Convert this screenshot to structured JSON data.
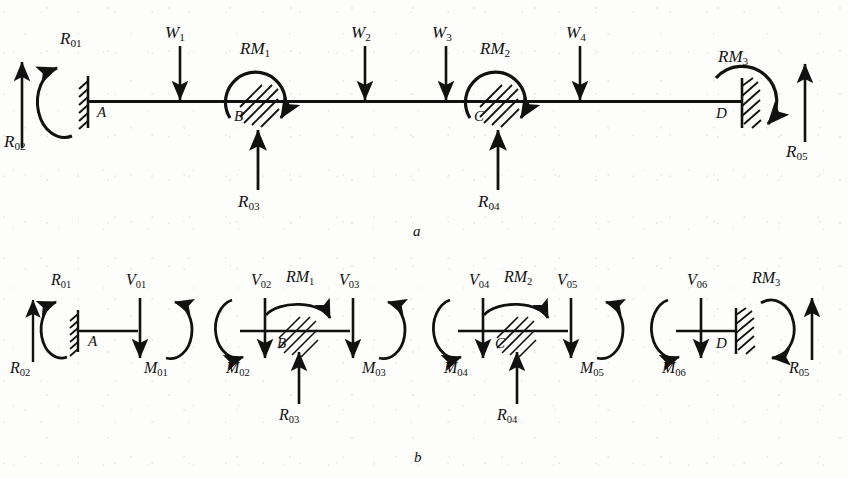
{
  "figure": {
    "type": "diagram",
    "panel_a_caption": "a",
    "panel_b_caption": "b",
    "colors": {
      "ink": "#111111",
      "background": "#fdfdfb"
    }
  },
  "panel_a": {
    "caption": "a",
    "beam": {
      "label": "beam-line"
    },
    "supports": [
      {
        "id": "A",
        "label": "A",
        "kind": "fixed-wall-left"
      },
      {
        "id": "B",
        "label": "B",
        "kind": "internal-hinge-hatched"
      },
      {
        "id": "C",
        "label": "C",
        "kind": "internal-hinge-hatched"
      },
      {
        "id": "D",
        "label": "D",
        "kind": "fixed-wall-right"
      }
    ],
    "loads": [
      {
        "name": "W",
        "sub": "1",
        "dir": "down"
      },
      {
        "name": "W",
        "sub": "2",
        "dir": "down"
      },
      {
        "name": "W",
        "sub": "3",
        "dir": "down"
      },
      {
        "name": "W",
        "sub": "4",
        "dir": "down"
      }
    ],
    "reactions": [
      {
        "name": "R",
        "sub": "01",
        "type": "moment",
        "sense": "ccw"
      },
      {
        "name": "R",
        "sub": "02",
        "type": "force",
        "dir": "up"
      },
      {
        "name": "R",
        "sub": "03",
        "type": "force",
        "dir": "up"
      },
      {
        "name": "R",
        "sub": "04",
        "type": "force",
        "dir": "up"
      },
      {
        "name": "R",
        "sub": "05",
        "type": "force",
        "dir": "up"
      }
    ],
    "restraint_moments": [
      {
        "name": "RM",
        "sub": "1",
        "sense": "cw"
      },
      {
        "name": "RM",
        "sub": "2",
        "sense": "cw"
      },
      {
        "name": "RM",
        "sub": "3",
        "sense": "cw"
      }
    ]
  },
  "panel_b": {
    "caption": "b",
    "segments": [
      {
        "id": "seg-1",
        "node_label": "A",
        "node_kind": "fixed-wall-left",
        "items": [
          {
            "name": "R",
            "sub": "01",
            "type": "moment",
            "sense": "ccw"
          },
          {
            "name": "R",
            "sub": "02",
            "type": "force",
            "dir": "up"
          },
          {
            "name": "V",
            "sub": "01",
            "type": "force",
            "dir": "down"
          },
          {
            "name": "M",
            "sub": "01",
            "type": "moment",
            "sense": "cw"
          }
        ]
      },
      {
        "id": "seg-2",
        "node_label": "B",
        "node_kind": "internal-hinge-hatched",
        "items": [
          {
            "name": "V",
            "sub": "02",
            "type": "force",
            "dir": "down"
          },
          {
            "name": "M",
            "sub": "02",
            "type": "moment",
            "sense": "ccw"
          },
          {
            "name": "RM",
            "sub": "1",
            "type": "moment",
            "sense": "cw"
          },
          {
            "name": "V",
            "sub": "03",
            "type": "force",
            "dir": "down"
          },
          {
            "name": "M",
            "sub": "03",
            "type": "moment",
            "sense": "cw"
          },
          {
            "name": "R",
            "sub": "03",
            "type": "force",
            "dir": "up"
          }
        ]
      },
      {
        "id": "seg-3",
        "node_label": "C",
        "node_kind": "internal-hinge-hatched",
        "items": [
          {
            "name": "V",
            "sub": "04",
            "type": "force",
            "dir": "down"
          },
          {
            "name": "M",
            "sub": "04",
            "type": "moment",
            "sense": "ccw"
          },
          {
            "name": "RM",
            "sub": "2",
            "type": "moment",
            "sense": "cw"
          },
          {
            "name": "V",
            "sub": "05",
            "type": "force",
            "dir": "down"
          },
          {
            "name": "M",
            "sub": "05",
            "type": "moment",
            "sense": "cw"
          },
          {
            "name": "R",
            "sub": "04",
            "type": "force",
            "dir": "up"
          }
        ]
      },
      {
        "id": "seg-4",
        "node_label": "D",
        "node_kind": "fixed-wall-right",
        "items": [
          {
            "name": "V",
            "sub": "06",
            "type": "force",
            "dir": "down"
          },
          {
            "name": "M",
            "sub": "06",
            "type": "moment",
            "sense": "ccw"
          },
          {
            "name": "RM",
            "sub": "3",
            "type": "moment",
            "sense": "cw"
          },
          {
            "name": "R",
            "sub": "05",
            "type": "force",
            "dir": "up"
          }
        ]
      }
    ]
  },
  "labels": {
    "a_caption": "a",
    "b_caption": "b",
    "A": "A",
    "B": "B",
    "C": "C",
    "D": "D",
    "W1": "W",
    "W1s": "1",
    "W2": "W",
    "W2s": "2",
    "W3": "W",
    "W3s": "3",
    "W4": "W",
    "W4s": "4",
    "R01": "R",
    "R01s": "01",
    "R02": "R",
    "R02s": "02",
    "R03": "R",
    "R03s": "03",
    "R04": "R",
    "R04s": "04",
    "R05": "R",
    "R05s": "05",
    "RM1": "RM",
    "RM1s": "1",
    "RM2": "RM",
    "RM2s": "2",
    "RM3": "RM",
    "RM3s": "3",
    "V01": "V",
    "V01s": "01",
    "V02": "V",
    "V02s": "02",
    "V03": "V",
    "V03s": "03",
    "V04": "V",
    "V04s": "04",
    "V05": "V",
    "V05s": "05",
    "V06": "V",
    "V06s": "06",
    "M01": "M",
    "M01s": "01",
    "M02": "M",
    "M02s": "02",
    "M03": "M",
    "M03s": "03",
    "M04": "M",
    "M04s": "04",
    "M05": "M",
    "M05s": "05",
    "M06": "M",
    "M06s": "06"
  }
}
